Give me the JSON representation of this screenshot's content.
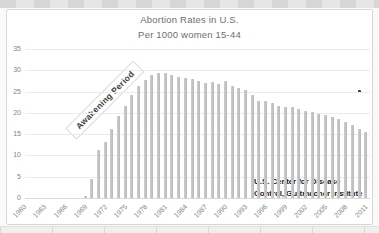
{
  "chart_data": {
    "type": "bar",
    "title": "Abortion Rates in U.S.",
    "subtitle": "Per 1000 women 15-44",
    "xlabel": "",
    "ylabel": "",
    "ylim": [
      0,
      35
    ],
    "yticks": [
      0,
      5,
      10,
      15,
      20,
      25,
      30,
      35
    ],
    "xticks": [
      1960,
      1963,
      1966,
      1969,
      1972,
      1975,
      1978,
      1981,
      1984,
      1987,
      1990,
      1993,
      1996,
      1999,
      2002,
      2005,
      2008,
      2011
    ],
    "grid": "horizontal",
    "legend": "none",
    "categories": [
      1960,
      1961,
      1962,
      1963,
      1964,
      1965,
      1966,
      1967,
      1968,
      1969,
      1970,
      1971,
      1972,
      1973,
      1974,
      1975,
      1976,
      1977,
      1978,
      1979,
      1980,
      1981,
      1982,
      1983,
      1984,
      1985,
      1986,
      1987,
      1988,
      1989,
      1990,
      1991,
      1992,
      1993,
      1994,
      1995,
      1996,
      1997,
      1998,
      1999,
      2000,
      2001,
      2002,
      2003,
      2004,
      2005,
      2006,
      2007,
      2008,
      2009,
      2010,
      2011
    ],
    "values": [
      0,
      0,
      0,
      0,
      0,
      0,
      0,
      0,
      0,
      0.5,
      4.5,
      11.2,
      13.2,
      16.3,
      19.3,
      21.7,
      24.2,
      26.4,
      27.7,
      28.8,
      29.3,
      29.3,
      28.8,
      28.5,
      28.1,
      28.0,
      27.4,
      26.9,
      27.3,
      26.8,
      27.4,
      26.3,
      25.9,
      25.4,
      24.1,
      22.9,
      22.9,
      22.2,
      21.6,
      21.4,
      21.3,
      20.9,
      20.5,
      20.2,
      19.7,
      19.4,
      19.0,
      18.5,
      17.9,
      17.1,
      16.3,
      15.6
    ],
    "annotations": [
      {
        "id": "awakening",
        "text": "Awakening Period",
        "rotation_deg": -45,
        "x_year": 1972,
        "y_value": 23
      },
      {
        "id": "source",
        "lines": [
          "U.S. Center for Disease",
          "Control, Guttmacher Institute"
        ],
        "x_year": 1994.3,
        "y_value": 5.2
      }
    ],
    "point_marker": {
      "x_year": 2010,
      "value": 25
    },
    "colors": {
      "bar": "#c3c3c3",
      "bar_edge_light": "#cfcfcf",
      "bar_edge_dark": "#b7b7b7",
      "gridline": "#ebebeb",
      "baseline": "#d9d9d9",
      "title_text": "#6e6e6e",
      "axis_text": "#858585",
      "annotation_text": "#3d3d3d",
      "source_text": "#1c1c1c",
      "marker": "#3c3c3c"
    }
  }
}
